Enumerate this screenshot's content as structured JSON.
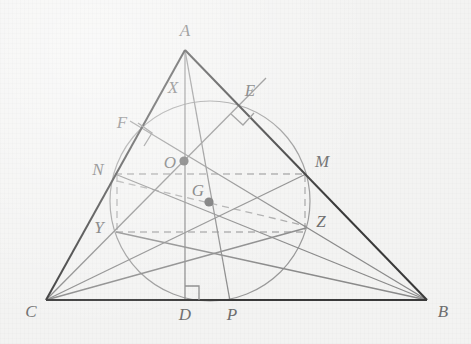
{
  "figure": {
    "background_color": "#f3f3f2",
    "colors": {
      "triangle_stroke": "#3a3a3a",
      "cevian_stroke": "#8a8a8a",
      "circle_stroke": "#9a9a9a",
      "dashed_stroke": "#a8a8a8",
      "point_fill": "#6f6f6f",
      "label_fill": "#6e6e6e"
    },
    "triangle": {
      "vertices": [
        {
          "name": "A",
          "x": 185,
          "y": 50,
          "label_x": 185,
          "label_y": 36
        },
        {
          "name": "B",
          "x": 427,
          "y": 300,
          "label_x": 443,
          "label_y": 317
        },
        {
          "name": "C",
          "x": 46,
          "y": 300,
          "label_x": 31,
          "label_y": 317
        }
      ]
    },
    "points": [
      {
        "name": "A",
        "x": 185,
        "y": 50,
        "label_x": 185,
        "label_y": 36,
        "dot": false,
        "role": "vertex"
      },
      {
        "name": "B",
        "x": 427,
        "y": 300,
        "label_x": 443,
        "label_y": 317,
        "dot": false,
        "role": "vertex"
      },
      {
        "name": "C",
        "x": 46,
        "y": 300,
        "label_x": 31,
        "label_y": 317,
        "dot": false,
        "role": "vertex"
      },
      {
        "name": "D",
        "x": 185,
        "y": 300,
        "label_x": 185,
        "label_y": 320,
        "dot": false,
        "role": "foot-of-altitude-from-A"
      },
      {
        "name": "P",
        "x": 230,
        "y": 300,
        "label_x": 232,
        "label_y": 320,
        "dot": false,
        "role": "point-on-BC"
      },
      {
        "name": "E",
        "x": 243,
        "y": 103,
        "label_x": 250,
        "label_y": 96,
        "dot": false,
        "role": "foot-of-altitude-from-C"
      },
      {
        "name": "F",
        "x": 143,
        "y": 133,
        "label_x": 122,
        "label_y": 128,
        "dot": false,
        "role": "foot-of-altitude-from-B"
      },
      {
        "name": "X",
        "x": 175,
        "y": 97,
        "label_x": 173,
        "label_y": 93,
        "dot": false,
        "role": "label-on-side-AC"
      },
      {
        "name": "M",
        "x": 306,
        "y": 174,
        "label_x": 322,
        "label_y": 167,
        "dot": false,
        "role": "midpoint-of-AB"
      },
      {
        "name": "N",
        "x": 115,
        "y": 174,
        "label_x": 98,
        "label_y": 175,
        "dot": false,
        "role": "midpoint-of-AC"
      },
      {
        "name": "Y",
        "x": 116,
        "y": 232,
        "label_x": 99,
        "label_y": 233,
        "dot": false,
        "role": "point-on-AC"
      },
      {
        "name": "Z",
        "x": 306,
        "y": 228,
        "label_x": 321,
        "label_y": 227,
        "dot": false,
        "role": "point-on-AB"
      },
      {
        "name": "O",
        "x": 184,
        "y": 161,
        "label_x": 170,
        "label_y": 164,
        "dot": true,
        "role": "circumcenter"
      },
      {
        "name": "G",
        "x": 209,
        "y": 202,
        "label_x": 198,
        "label_y": 193,
        "dot": true,
        "role": "centroid"
      }
    ],
    "circle": {
      "cx": 210,
      "cy": 201,
      "r": 100,
      "label": "circumcircle"
    },
    "solid_segments": [
      {
        "from": "A",
        "to": "B",
        "kind": "triangle-side"
      },
      {
        "from": "A",
        "to": "C",
        "kind": "triangle-side"
      },
      {
        "from": "B",
        "to": "C",
        "kind": "triangle-side"
      },
      {
        "from": "A",
        "to": "D",
        "kind": "altitude"
      },
      {
        "from": "A",
        "to": "P",
        "kind": "cevian"
      },
      {
        "from": "C",
        "to": "E",
        "kind": "altitude"
      },
      {
        "from": "B",
        "to": "F",
        "kind": "altitude"
      },
      {
        "from": "C",
        "to": "M",
        "kind": "median"
      },
      {
        "from": "B",
        "to": "N",
        "kind": "median"
      },
      {
        "from": "C",
        "to": "Z",
        "kind": "cevian"
      },
      {
        "from": "B",
        "to": "Y",
        "kind": "cevian"
      }
    ],
    "dashed_segments": [
      {
        "from": "N",
        "to": "M",
        "kind": "horizontal-chord"
      },
      {
        "from": "Y",
        "to": "Z",
        "kind": "horizontal-chord"
      },
      {
        "from": "N",
        "to": "Y",
        "kind": "vertical-chord"
      },
      {
        "from": "M",
        "to": "Z",
        "kind": "vertical-chord"
      },
      {
        "from": "N",
        "to": "Z",
        "kind": "diagonal-chord"
      }
    ],
    "right_angle_marks": [
      {
        "at": "D",
        "label": "right-angle-at-D"
      },
      {
        "at": "E",
        "label": "right-angle-at-E"
      },
      {
        "at": "F",
        "label": "right-angle-at-F"
      }
    ]
  }
}
